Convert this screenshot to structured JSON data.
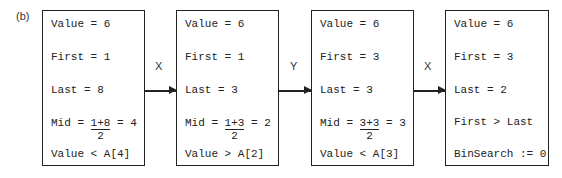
{
  "figure_label": "(b)",
  "boxes": [
    {
      "value": "Value = 6",
      "first": "First = 1",
      "last": "Last = 8",
      "mid_prefix": "Mid = ",
      "mid_num": "1+8",
      "mid_den": "2",
      "mid_suffix": " = 4",
      "compare": "Value < A[4]"
    },
    {
      "value": "Value = 6",
      "first": "First = 1",
      "last": "Last = 3",
      "mid_prefix": "Mid = ",
      "mid_num": "1+3",
      "mid_den": "2",
      "mid_suffix": " = 2",
      "compare": "Value > A[2]"
    },
    {
      "value": "Value = 6",
      "first": "First = 3",
      "last": "Last = 3",
      "mid_prefix": "Mid = ",
      "mid_num": "3+3",
      "mid_den": "2",
      "mid_suffix": " = 3",
      "compare": "Value < A[3]"
    },
    {
      "value": "Value = 6",
      "first": "First = 3",
      "last": "Last = 2",
      "condition": "First > Last",
      "result": "BinSearch := 0"
    }
  ],
  "arrows": [
    {
      "label": "X"
    },
    {
      "label": "Y"
    },
    {
      "label": "X"
    }
  ]
}
